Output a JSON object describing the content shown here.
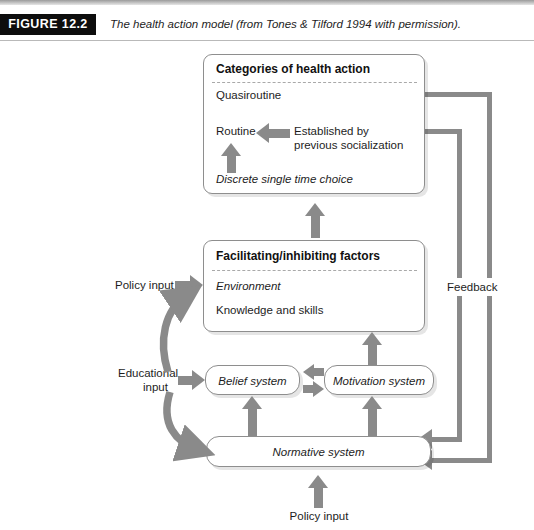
{
  "figure": {
    "tag": "FIGURE 12.2",
    "caption": "The health action model (from Tones & Tilford 1994 with permission)."
  },
  "colors": {
    "arrow": "#8a8a8a",
    "box_border": "#8e8e8e",
    "tag_bg": "#0d0d0d",
    "text": "#1d1d1d"
  },
  "diagram": {
    "categories_box": {
      "title": "Categories of health action",
      "items": [
        {
          "label": "Quasiroutine"
        },
        {
          "label": "Routine"
        },
        {
          "label": "Established by\nprevious socialization"
        },
        {
          "label": "Discrete single time choice"
        }
      ],
      "established_line1": "Established by",
      "established_line2": "previous socialization",
      "discrete": "Discrete single time choice",
      "quasiroutine": "Quasiroutine",
      "routine": "Routine"
    },
    "facilitating_box": {
      "title": "Facilitating/inhibiting factors",
      "environment": "Environment",
      "knowledge": "Knowledge and skills"
    },
    "belief_box": {
      "label": "Belief system"
    },
    "motivation_box": {
      "label": "Motivation system"
    },
    "normative_box": {
      "label": "Normative system"
    },
    "labels": {
      "policy_input_left": "Policy input",
      "policy_input_bottom": "Policy input",
      "educational_input_line1": "Educational",
      "educational_input_line2": "input",
      "feedback": "Feedback"
    }
  }
}
